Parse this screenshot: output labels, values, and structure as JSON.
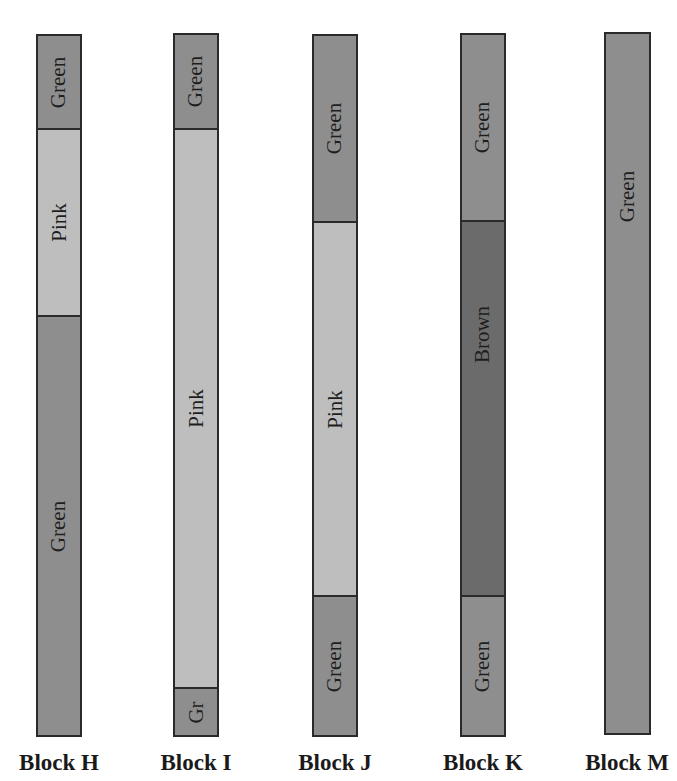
{
  "colors": {
    "Green": "#8e8e8e",
    "Pink": "#bebebe",
    "Brown": "#6b6b6b",
    "border": "#2a2a2a"
  },
  "blocks": [
    {
      "label": "Block H",
      "segments": [
        {
          "label": "Green",
          "color": "Green"
        },
        {
          "label": "Pink",
          "color": "Pink"
        },
        {
          "label": "Green",
          "color": "Green"
        }
      ]
    },
    {
      "label": "Block I",
      "segments": [
        {
          "label": "Green",
          "color": "Green"
        },
        {
          "label": "Pink",
          "color": "Pink"
        },
        {
          "label": "Gr",
          "color": "Green"
        }
      ]
    },
    {
      "label": "Block J",
      "segments": [
        {
          "label": "Green",
          "color": "Green"
        },
        {
          "label": "Pink",
          "color": "Pink"
        },
        {
          "label": "Green",
          "color": "Green"
        }
      ]
    },
    {
      "label": "Block K",
      "segments": [
        {
          "label": "Green",
          "color": "Green"
        },
        {
          "label": "Brown",
          "color": "Brown"
        },
        {
          "label": "Green",
          "color": "Green"
        }
      ]
    },
    {
      "label": "Block M",
      "segments": [
        {
          "label": "Green",
          "color": "Green"
        }
      ]
    }
  ]
}
